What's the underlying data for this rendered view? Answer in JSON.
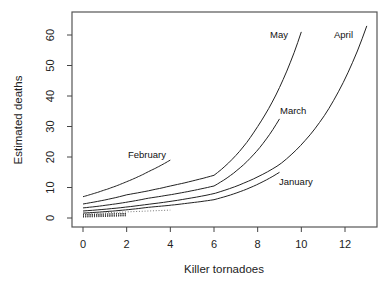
{
  "chart_data": {
    "type": "line",
    "title": "",
    "xlabel": "Killer tornadoes",
    "ylabel": "Estimated deaths",
    "xlim": [
      -0.5,
      13.5
    ],
    "ylim": [
      -2.5,
      68
    ],
    "xticks": [
      0,
      2,
      4,
      6,
      8,
      10,
      12
    ],
    "yticks": [
      0,
      10,
      20,
      30,
      40,
      50,
      60
    ],
    "grid": false,
    "legend": "none (direct labels on curves)",
    "series": [
      {
        "name": "February",
        "style": "solid",
        "label": "February",
        "x": [
          0,
          1,
          2,
          3,
          4
        ],
        "y": [
          7.0,
          9.2,
          11.9,
          15.2,
          19.0
        ]
      },
      {
        "name": "May",
        "style": "solid",
        "label": "May",
        "x": [
          0,
          2,
          4,
          6,
          8,
          10
        ],
        "y": [
          4.6,
          7.6,
          10.5,
          14.0,
          30.0,
          61.0
        ]
      },
      {
        "name": "March",
        "style": "solid",
        "label": "March",
        "x": [
          0,
          3,
          6,
          9
        ],
        "y": [
          3.3,
          6.5,
          10.5,
          32.5
        ]
      },
      {
        "name": "April",
        "style": "solid",
        "label": "April",
        "x": [
          0,
          3,
          6,
          9,
          11,
          13
        ],
        "y": [
          2.3,
          4.5,
          8.0,
          17.5,
          33.0,
          63.0
        ]
      },
      {
        "name": "January",
        "style": "solid",
        "label": "January",
        "x": [
          0,
          3,
          6,
          9
        ],
        "y": [
          1.6,
          3.5,
          6.0,
          15.0
        ]
      },
      {
        "name": "Dotted series A",
        "style": "dotted",
        "label": "",
        "x": [
          0,
          2
        ],
        "y": [
          1.0,
          1.5
        ]
      },
      {
        "name": "Dotted series B",
        "style": "dotted",
        "label": "",
        "x": [
          0,
          2
        ],
        "y": [
          0.5,
          0.9
        ]
      },
      {
        "name": "Dotted series C",
        "style": "dotted-light",
        "label": "",
        "x": [
          0,
          4
        ],
        "y": [
          1.4,
          2.6
        ]
      }
    ],
    "annotations": [
      {
        "text": "February",
        "near_series": "February"
      },
      {
        "text": "May",
        "near_series": "May"
      },
      {
        "text": "April",
        "near_series": "April"
      },
      {
        "text": "March",
        "near_series": "March"
      },
      {
        "text": "January",
        "near_series": "January"
      }
    ]
  }
}
